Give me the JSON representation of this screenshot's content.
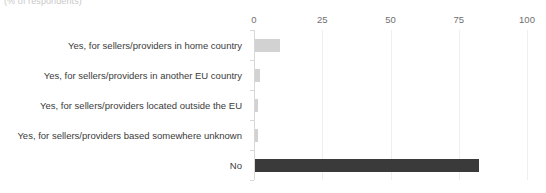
{
  "header": {
    "subtitle": "(% of respondents)"
  },
  "chart_data": {
    "type": "bar",
    "orientation": "horizontal",
    "title": "",
    "subtitle": "(% of respondents)",
    "xlabel": "",
    "ylabel": "",
    "xlim": [
      0,
      100
    ],
    "xticks": [
      "0",
      "25",
      "50",
      "75",
      "100"
    ],
    "xtick_values": [
      0,
      25,
      50,
      75,
      100
    ],
    "grid": "vertical",
    "legend": "none",
    "categories": [
      "Yes, for sellers/providers in home country",
      "Yes, for sellers/providers in another EU country",
      "Yes, for sellers/providers located outside the EU",
      "Yes, for sellers/providers based somewhere unknown",
      "No"
    ],
    "values": [
      9,
      2,
      1,
      1,
      82
    ],
    "colors": [
      "#d2d2d2",
      "#d2d2d2",
      "#d2d2d2",
      "#d2d2d2",
      "#3a3a3a"
    ],
    "series": [
      {
        "name": "Share of respondents",
        "values": [
          9,
          2,
          1,
          1,
          82
        ]
      }
    ]
  },
  "style": {
    "bar_light": "#d2d2d2",
    "bar_dark": "#3a3a3a",
    "grid_color": "#efefef",
    "axis_color": "#d8d8d8",
    "label_color": "#3b3b3b",
    "tick_color": "#6f6f6f"
  }
}
